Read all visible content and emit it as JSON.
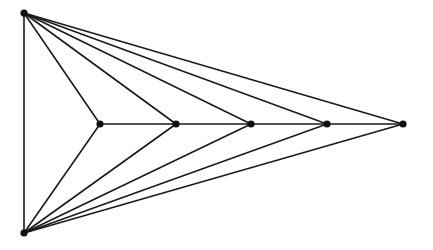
{
  "diagram": {
    "type": "graph",
    "colors": {
      "edge": "#1a1a1a",
      "node": "#111111",
      "background": "#ffffff"
    },
    "nodes": [
      {
        "id": "T",
        "x": 24,
        "y": 13,
        "r": 3.6
      },
      {
        "id": "B",
        "x": 24,
        "y": 233,
        "r": 3.6
      },
      {
        "id": "P1",
        "x": 100,
        "y": 124,
        "r": 3.6
      },
      {
        "id": "P2",
        "x": 176,
        "y": 124,
        "r": 3.6
      },
      {
        "id": "P3",
        "x": 251,
        "y": 124,
        "r": 3.6
      },
      {
        "id": "P4",
        "x": 327,
        "y": 124,
        "r": 3.6
      },
      {
        "id": "P5",
        "x": 403,
        "y": 124,
        "r": 3.6
      }
    ],
    "edges": [
      [
        "T",
        "B"
      ],
      [
        "P1",
        "P2"
      ],
      [
        "P2",
        "P3"
      ],
      [
        "P3",
        "P4"
      ],
      [
        "P4",
        "P5"
      ],
      [
        "T",
        "P1"
      ],
      [
        "T",
        "P2"
      ],
      [
        "T",
        "P3"
      ],
      [
        "T",
        "P4"
      ],
      [
        "T",
        "P5"
      ],
      [
        "B",
        "P1"
      ],
      [
        "B",
        "P2"
      ],
      [
        "B",
        "P3"
      ],
      [
        "B",
        "P4"
      ],
      [
        "B",
        "P5"
      ]
    ]
  }
}
